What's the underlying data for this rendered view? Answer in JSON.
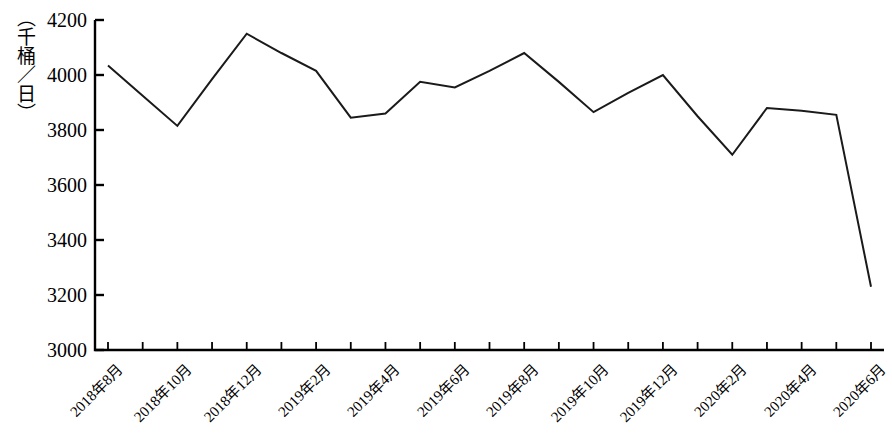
{
  "chart_data": {
    "type": "line",
    "title": "",
    "subtitle": "",
    "xlabel": "",
    "ylabel": "（千桶／日）",
    "ylim": [
      3000,
      4200
    ],
    "ytick_values": [
      3000,
      3200,
      3400,
      3600,
      3800,
      4000,
      4200
    ],
    "ytick_labels": [
      "3000",
      "3200",
      "3400",
      "3600",
      "3800",
      "4000",
      "4200"
    ],
    "grid": false,
    "legend": null,
    "legend_position": "none",
    "line_color": "#1a1a1a",
    "line_width": 2,
    "axis_color": "#000000",
    "categories": [
      "2018年8月",
      "2018年9月",
      "2018年10月",
      "2018年11月",
      "2018年12月",
      "2019年1月",
      "2019年2月",
      "2019年3月",
      "2019年4月",
      "2019年5月",
      "2019年6月",
      "2019年7月",
      "2019年8月",
      "2019年9月",
      "2019年10月",
      "2019年11月",
      "2019年12月",
      "2020年1月",
      "2020年2月",
      "2020年3月",
      "2020年4月",
      "2020年5月",
      "2020年6月"
    ],
    "xtick_labels": [
      "2018年8月",
      "2018年10月",
      "2018年12月",
      "2019年2月",
      "2019年4月",
      "2019年6月",
      "2019年8月",
      "2019年10月",
      "2019年12月",
      "2020年2月",
      "2020年4月",
      "2020年6月"
    ],
    "values": [
      4035,
      3925,
      3815,
      3985,
      4150,
      4080,
      4015,
      3845,
      3860,
      3975,
      3955,
      4015,
      4080,
      3975,
      3865,
      3935,
      4000,
      3850,
      3710,
      3880,
      3870,
      3855,
      3230
    ],
    "series": [
      {
        "name": "产量",
        "values": [
          4035,
          3925,
          3815,
          3985,
          4150,
          4080,
          4015,
          3845,
          3860,
          3975,
          3955,
          4015,
          4080,
          3975,
          3865,
          3935,
          4000,
          3850,
          3710,
          3880,
          3870,
          3855,
          3230
        ]
      }
    ],
    "annotations": []
  },
  "axis": {
    "unit_label": "（千桶／日）"
  }
}
